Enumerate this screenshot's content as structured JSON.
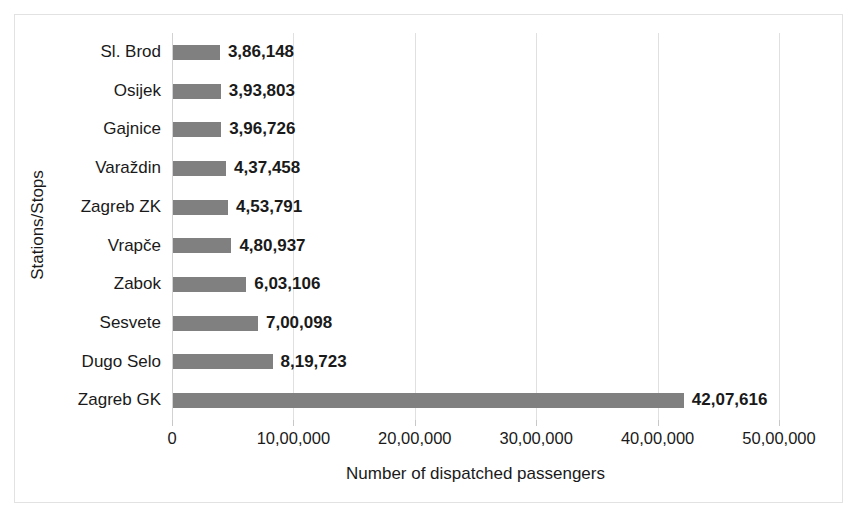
{
  "chart_data": {
    "type": "bar",
    "orientation": "horizontal",
    "title": "",
    "xlabel": "Number of dispatched passengers",
    "ylabel": "Stations/Stops",
    "categories": [
      "Sl. Brod",
      "Osijek",
      "Gajnice",
      "Varaždin",
      "Zagreb ZK",
      "Vrapče",
      "Zabok",
      "Sesvete",
      "Dugo Selo",
      "Zagreb GK"
    ],
    "values": [
      386148,
      393803,
      396726,
      437458,
      453791,
      480937,
      603106,
      700098,
      819723,
      4207616
    ],
    "value_labels": [
      "3,86,148",
      "3,93,803",
      "3,96,726",
      "4,37,458",
      "4,53,791",
      "4,80,937",
      "6,03,106",
      "7,00,098",
      "8,19,723",
      "42,07,616"
    ],
    "xlim": [
      0,
      5000000
    ],
    "xticks": [
      0,
      1000000,
      2000000,
      3000000,
      4000000,
      5000000
    ],
    "xtick_labels": [
      "0",
      "10,00,000",
      "20,00,000",
      "30,00,000",
      "40,00,000",
      "50,00,000"
    ],
    "grid": true,
    "grid_axis": "x",
    "legend": false,
    "bar_color": "#808080",
    "gridline_color": "#e0e0e0",
    "frame_color": "#e2e2e2",
    "data_labels_shown": true
  }
}
